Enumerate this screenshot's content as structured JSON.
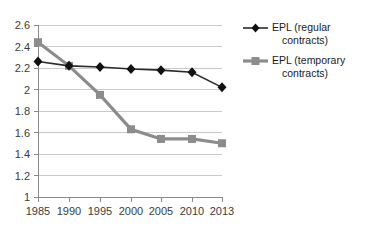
{
  "chart_data": {
    "type": "line",
    "title": "",
    "subtitle": "",
    "xlabel": "",
    "ylabel": "",
    "categories": [
      "1985",
      "1990",
      "1995",
      "2000",
      "2005",
      "2010",
      "2013"
    ],
    "x": [
      1985,
      1990,
      1995,
      2000,
      2005,
      2010,
      2013
    ],
    "series": [
      {
        "name": "EPL (regular contracts)",
        "values": [
          2.26,
          2.22,
          2.21,
          2.19,
          2.18,
          2.16,
          2.02
        ],
        "color": "#2b2b2b",
        "marker": "diamond"
      },
      {
        "name": "EPL (temporary contracts)",
        "values": [
          2.44,
          2.22,
          1.95,
          1.63,
          1.54,
          1.54,
          1.5
        ],
        "color": "#8c8c8c",
        "marker": "square"
      }
    ],
    "ylim": [
      1,
      2.6
    ],
    "yticks": [
      1,
      1.2,
      1.4,
      1.6,
      1.8,
      2,
      2.2,
      2.4,
      2.6
    ],
    "ytick_labels": [
      "1",
      "1.2",
      "1.4",
      "1.6",
      "1.8",
      "2",
      "2.2",
      "2.4",
      "2.6"
    ],
    "grid": true,
    "grid_axis": "y",
    "legend_position": "right"
  },
  "legend": {
    "items": [
      {
        "label_line1": "EPL (regular",
        "label_line2": "contracts)",
        "marker": "diamond",
        "color": "#2b2b2b"
      },
      {
        "label_line1": "EPL (temporary",
        "label_line2": "contracts)",
        "marker": "square",
        "color": "#8c8c8c"
      }
    ]
  },
  "axes": {
    "y_tick_labels": [
      "2.6",
      "2.4",
      "2.2",
      "2",
      "1.8",
      "1.6",
      "1.4",
      "1.2",
      "1"
    ],
    "x_tick_labels": [
      "1985",
      "1990",
      "1995",
      "2000",
      "2005",
      "2010",
      "2013"
    ]
  }
}
